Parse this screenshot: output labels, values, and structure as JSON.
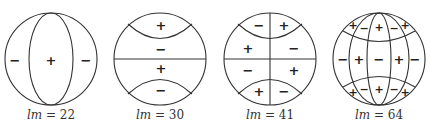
{
  "figure": {
    "panels": [
      {
        "id": "lm22",
        "caption_var": "lm",
        "caption_eq": " = 22",
        "signs": [
          {
            "s": "−",
            "x": 15,
            "y": 60
          },
          {
            "s": "+",
            "x": 51,
            "y": 60
          },
          {
            "s": "−",
            "x": 84,
            "y": 60
          }
        ]
      },
      {
        "id": "lm30",
        "caption_var": "lm",
        "caption_eq": " = 30",
        "signs": [
          {
            "s": "+",
            "x": 161,
            "y": 24
          },
          {
            "s": "−",
            "x": 161,
            "y": 49
          },
          {
            "s": "+",
            "x": 161,
            "y": 68
          },
          {
            "s": "−",
            "x": 161,
            "y": 90
          }
        ]
      },
      {
        "id": "lm41",
        "caption_var": "lm",
        "caption_eq": " = 41",
        "signs": [
          {
            "s": "−",
            "x": 259,
            "y": 24
          },
          {
            "s": "+",
            "x": 283,
            "y": 24
          },
          {
            "s": "+",
            "x": 248,
            "y": 48
          },
          {
            "s": "−",
            "x": 294,
            "y": 48
          },
          {
            "s": "−",
            "x": 248,
            "y": 70
          },
          {
            "s": "+",
            "x": 294,
            "y": 70
          },
          {
            "s": "+",
            "x": 259,
            "y": 91
          },
          {
            "s": "−",
            "x": 283,
            "y": 91
          }
        ]
      },
      {
        "id": "lm64",
        "caption_var": "lm",
        "caption_eq": " = 64",
        "signs": [
          {
            "s": "+",
            "x": 353,
            "y": 25,
            "small": true
          },
          {
            "s": "−",
            "x": 364,
            "y": 28,
            "small": true
          },
          {
            "s": "+",
            "x": 379,
            "y": 27,
            "small": true
          },
          {
            "s": "−",
            "x": 394,
            "y": 28,
            "small": true
          },
          {
            "s": "+",
            "x": 405,
            "y": 25,
            "small": true
          },
          {
            "s": "−",
            "x": 344,
            "y": 59
          },
          {
            "s": "+",
            "x": 359,
            "y": 59
          },
          {
            "s": "−",
            "x": 379,
            "y": 59
          },
          {
            "s": "+",
            "x": 399,
            "y": 59
          },
          {
            "s": "−",
            "x": 414,
            "y": 59
          },
          {
            "s": "+",
            "x": 353,
            "y": 92,
            "small": true
          },
          {
            "s": "−",
            "x": 364,
            "y": 89,
            "small": true
          },
          {
            "s": "+",
            "x": 379,
            "y": 89,
            "small": true
          },
          {
            "s": "−",
            "x": 394,
            "y": 89,
            "small": true
          },
          {
            "s": "+",
            "x": 405,
            "y": 92,
            "small": true
          }
        ]
      }
    ]
  }
}
